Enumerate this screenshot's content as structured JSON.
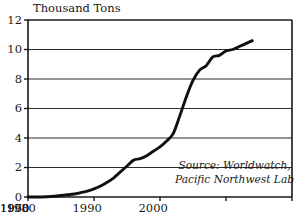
{
  "chart_data": {
    "type": "line",
    "title": "Thousand Tons",
    "xlabel": "",
    "ylabel": "Thousand Tons",
    "xlim": [
      1960,
      2000
    ],
    "ylim": [
      0,
      12
    ],
    "grid": true,
    "legend_position": "none",
    "x_ticks": [
      "1960",
      "1970",
      "1980",
      "1990",
      "2000"
    ],
    "x_tick_values": [
      1960,
      1970,
      1980,
      1990,
      2000
    ],
    "y_ticks": [
      "0",
      "2",
      "4",
      "6",
      "8",
      "10",
      "12"
    ],
    "y_tick_values": [
      0,
      2,
      4,
      6,
      8,
      10,
      12
    ],
    "annotations": [
      {
        "name": "source-note",
        "line1": "Source: Worldwatch,",
        "line2": "Pacific Northwest Lab"
      }
    ],
    "series": [
      {
        "name": "Production",
        "x": [
          1960,
          1962,
          1964,
          1965,
          1966,
          1967,
          1968,
          1969,
          1970,
          1971,
          1972,
          1973,
          1974,
          1975,
          1976,
          1977,
          1978,
          1979,
          1980,
          1981,
          1982,
          1983,
          1984,
          1985,
          1986,
          1987,
          1988,
          1989,
          1990,
          1991,
          1992,
          1993,
          1994
        ],
        "values": [
          0.0,
          0.0,
          0.05,
          0.1,
          0.15,
          0.2,
          0.3,
          0.4,
          0.55,
          0.75,
          1.0,
          1.3,
          1.7,
          2.1,
          2.5,
          2.6,
          2.8,
          3.1,
          3.4,
          3.8,
          4.3,
          5.5,
          6.8,
          7.9,
          8.6,
          8.9,
          9.5,
          9.6,
          9.9,
          10.0,
          10.2,
          10.4,
          10.6
        ]
      }
    ],
    "colors": {
      "line": "#101010",
      "grid": "#2b2b2b",
      "axis": "#1a1a1a",
      "background": "#ffffff"
    }
  },
  "plot_geometry": {
    "left": 28,
    "right": 292,
    "top": 20,
    "bottom": 197
  }
}
